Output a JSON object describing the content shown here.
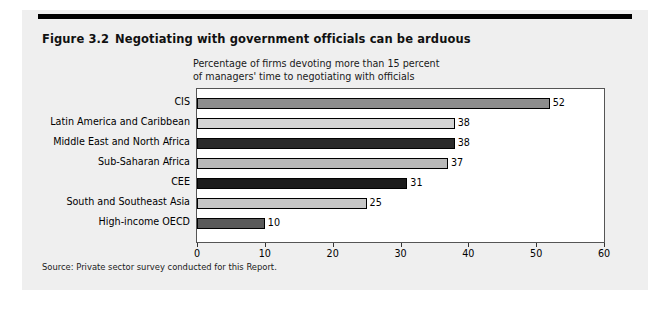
{
  "figure": {
    "number": "Figure 3.2",
    "title": "Negotiating with government officials can be arduous",
    "source": "Source: Private sector survey conducted for this Report."
  },
  "chart_data": {
    "type": "bar",
    "orientation": "horizontal",
    "title": "Negotiating with government officials can be arduous",
    "subtitle_line1": "Percentage of firms devoting more than 15 percent",
    "subtitle_line2": "of managers' time to negotiating with officials",
    "xlabel": "",
    "ylabel": "",
    "xlim": [
      0,
      60
    ],
    "xticks": [
      0,
      10,
      20,
      30,
      40,
      50,
      60
    ],
    "xtick_labels": [
      "0",
      "10",
      "20",
      "30",
      "40",
      "50",
      "60"
    ],
    "grid": false,
    "legend": false,
    "categories": [
      "CIS",
      "Latin America and Caribbean",
      "Middle East and North Africa",
      "Sub-Saharan Africa",
      "CEE",
      "South and Southeast Asia",
      "High-income OECD"
    ],
    "values": [
      52,
      38,
      38,
      37,
      31,
      25,
      10
    ],
    "value_labels": [
      "52",
      "38",
      "38",
      "37",
      "31",
      "25",
      "10"
    ],
    "bar_colors": [
      "#8d8d8d",
      "#d4d4d4",
      "#2b2b2b",
      "#b9b9b9",
      "#1c1c1c",
      "#c6c6c6",
      "#5a5a5a"
    ]
  }
}
